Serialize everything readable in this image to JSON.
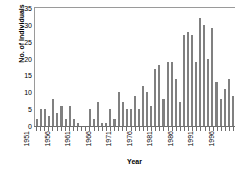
{
  "chart_data": {
    "type": "bar",
    "title": "",
    "xlabel": "Year",
    "ylabel": "No. of Individuals",
    "ylim": [
      0,
      35
    ],
    "yticks": [
      0,
      5,
      10,
      15,
      20,
      25,
      30,
      35
    ],
    "grid": false,
    "legend": null,
    "bar_color": "#808080",
    "axis_color": "#8a8a8a",
    "xtick_labels": [
      "1951",
      "1956",
      "1961",
      "1966",
      "1971",
      "1976",
      "1981",
      "1986",
      "1991",
      "1996"
    ],
    "xtick_years": [
      1951,
      1956,
      1961,
      1966,
      1971,
      1976,
      1981,
      1986,
      1991,
      1996
    ],
    "categories": [
      "1951",
      "1952",
      "1953",
      "1954",
      "1955",
      "1956",
      "1957",
      "1958",
      "1959",
      "1960",
      "1961",
      "1962",
      "1963",
      "1964",
      "1965",
      "1966",
      "1967",
      "1968",
      "1969",
      "1970",
      "1971",
      "1972",
      "1973",
      "1974",
      "1975",
      "1976",
      "1977",
      "1978",
      "1979",
      "1980",
      "1981",
      "1982",
      "1983",
      "1984",
      "1985",
      "1986",
      "1987",
      "1988",
      "1989",
      "1990",
      "1991",
      "1992",
      "1993",
      "1994",
      "1995",
      "1996",
      "1997",
      "1998",
      "1999"
    ],
    "values": [
      2,
      5,
      5,
      3,
      8,
      4,
      6,
      2,
      6,
      2,
      1,
      0,
      0,
      5,
      2,
      7,
      1,
      1,
      5,
      2,
      10,
      7,
      5,
      5,
      9,
      5,
      12,
      10,
      6,
      17,
      18,
      8,
      19,
      19,
      14,
      7,
      27,
      28,
      27,
      19,
      32,
      30,
      20,
      29,
      13,
      8,
      11,
      14,
      9
    ]
  }
}
